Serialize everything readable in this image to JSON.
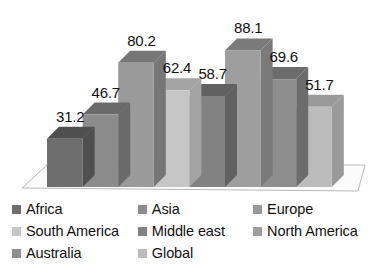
{
  "chart_data": {
    "type": "bar",
    "title": "",
    "subtitle": "",
    "xlabel": "",
    "ylabel": "",
    "grid": false,
    "legend_position": "bottom",
    "axis_visible": false,
    "style": "3d-column-grayscale",
    "ylim": [
      0,
      100
    ],
    "categories": [
      "Africa",
      "Asia",
      "Europe",
      "South America",
      "Middle east",
      "North America",
      "Australia",
      "Global"
    ],
    "values": [
      31.2,
      46.7,
      80.2,
      62.4,
      58.7,
      88.1,
      69.6,
      51.7
    ],
    "data_labels": [
      "31.2",
      "46.7",
      "80.2",
      "62.4",
      "58.7",
      "88.1",
      "69.6",
      "51.7"
    ],
    "series": [
      {
        "name": "",
        "values": [
          31.2,
          46.7,
          80.2,
          62.4,
          58.7,
          88.1,
          69.6,
          51.7
        ]
      }
    ],
    "colors": [
      "#6e6e6e",
      "#8c8c8c",
      "#9a9a9a",
      "#c6c6c6",
      "#828282",
      "#9e9e9e",
      "#8e8e8e",
      "#bcbcbc"
    ],
    "top_face_colors": [
      "#4f4f4f",
      "#6a6a6a",
      "#767676",
      "#a4a4a4",
      "#616161",
      "#7a7a7a",
      "#6c6c6c",
      "#9a9a9a"
    ]
  },
  "legend": {
    "entries": [
      {
        "label": "Africa",
        "color": "#6e6e6e"
      },
      {
        "label": "Asia",
        "color": "#8c8c8c"
      },
      {
        "label": "Europe",
        "color": "#9a9a9a"
      },
      {
        "label": "South America",
        "color": "#c6c6c6"
      },
      {
        "label": "Middle east",
        "color": "#828282"
      },
      {
        "label": "North America",
        "color": "#9e9e9e"
      },
      {
        "label": "Australia",
        "color": "#8e8e8e"
      },
      {
        "label": "Global",
        "color": "#bcbcbc"
      }
    ]
  },
  "floor": {
    "fill": "#fbfbfb",
    "stroke": "#b9b9b9"
  }
}
